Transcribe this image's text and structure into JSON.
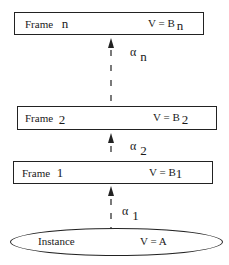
{
  "diagram": {
    "type": "inheritance-chain",
    "nodes": [
      {
        "id": "frame-n",
        "shape": "rectangle",
        "name": "Frame",
        "index": "n",
        "value_label": "V = B",
        "value_sub": "n"
      },
      {
        "id": "frame-2",
        "shape": "rectangle",
        "name": "Frame",
        "index": "2",
        "value_label": "V = B",
        "value_sub": "2"
      },
      {
        "id": "frame-1",
        "shape": "rectangle",
        "name": "Frame",
        "index": "1",
        "value_label": "V = B",
        "value_sub": "1"
      },
      {
        "id": "instance",
        "shape": "ellipse",
        "name": "Instance",
        "value_label": "V = A"
      }
    ],
    "edges": [
      {
        "from": "frame-2",
        "to": "frame-n",
        "label": "α",
        "label_sub": "n",
        "style": "dashed-arrow"
      },
      {
        "from": "frame-1",
        "to": "frame-2",
        "label": "α",
        "label_sub": "2",
        "style": "dashed-arrow"
      },
      {
        "from": "instance",
        "to": "frame-1",
        "label": "α",
        "label_sub": "1",
        "style": "dashed-arrow"
      }
    ],
    "colors": {
      "stroke": "#222222",
      "background": "#ffffff",
      "text": "#1a1a1a"
    }
  }
}
